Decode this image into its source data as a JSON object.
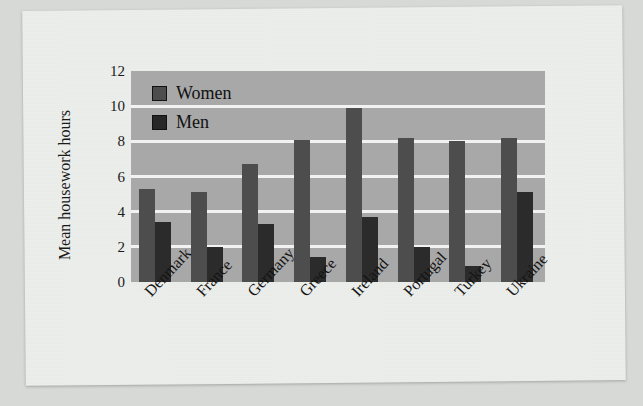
{
  "chart_data": {
    "type": "bar",
    "title": "",
    "subtitle": "",
    "xlabel": "",
    "ylabel": "Mean housework hours",
    "ylim": [
      0,
      12
    ],
    "yticks": [
      "0",
      "2",
      "4",
      "6",
      "8",
      "10",
      "12"
    ],
    "ytick_values": [
      0,
      2,
      4,
      6,
      8,
      10,
      12
    ],
    "grid": true,
    "grid_axis": "y",
    "legend_position": "top-left inside plot",
    "categories": [
      "Denmark",
      "France",
      "Germany",
      "Greece",
      "Ireland",
      "Portugal",
      "Turkey",
      "Ukraine"
    ],
    "series": [
      {
        "name": "Women",
        "color": "#4d4d4d",
        "values": [
          5.3,
          5.1,
          6.7,
          8.1,
          9.9,
          8.2,
          8.0,
          8.2
        ]
      },
      {
        "name": "Men",
        "color": "#2b2b2b",
        "values": [
          3.4,
          2.0,
          3.3,
          1.4,
          3.7,
          2.0,
          0.9,
          5.1
        ]
      }
    ],
    "plot_background": "#a8a8a8",
    "gridline_color": "#f2f2f2",
    "page_background": "#eceeeb"
  },
  "figure": {
    "axis_label_y": "Mean housework hours",
    "legend": [
      {
        "label": "Women",
        "swatch": "women-swatch"
      },
      {
        "label": "Men",
        "swatch": "men-swatch"
      }
    ]
  }
}
